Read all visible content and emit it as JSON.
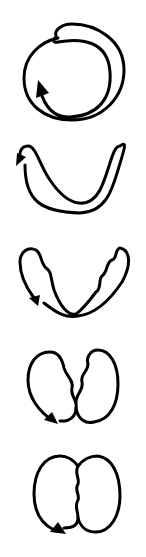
{
  "diagram": {
    "stroke_color": "#000000",
    "background": "#ffffff",
    "stages": [
      {
        "index": 1,
        "shape": "looped-circle-with-arrow"
      },
      {
        "index": 2,
        "shape": "crossed-v-loop-with-arrow"
      },
      {
        "index": 3,
        "shape": "crossed-v-loop-wavy-with-arrow"
      },
      {
        "index": 4,
        "shape": "two-lobes-wavy-crossed-with-arrow"
      },
      {
        "index": 5,
        "shape": "two-lobes-joined-wavy-seam-with-arrow"
      }
    ]
  }
}
